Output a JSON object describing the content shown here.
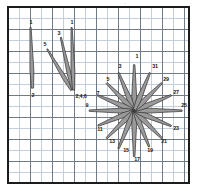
{
  "figure": {
    "kind": "petal-rose-diagram",
    "background": "#ffffff",
    "frame_color": "#1c1c1c",
    "grid_minor_color": "#c3cfdd",
    "grid_major_color": "#707b87",
    "petal_fill": "#9a9a9a",
    "petal_stroke": "#2b2b2b",
    "label_color": "#1a1a1a",
    "top_mark": "·"
  },
  "chart_data": {
    "type": "scatter",
    "title": "",
    "subtitle": "",
    "xlabel": "",
    "ylabel": "",
    "grid": true,
    "legend_position": "none",
    "annotations": [
      "Left cluster of three narrow petals converging at a common base labeled 2,4,6",
      "Right radial starburst of sixteen petals about a common centre, tips labelled with odd numbers 1 through 31"
    ],
    "groups": [
      {
        "name": "left-cluster",
        "base_label": "2,4,6",
        "petals": [
          {
            "tip_label": "1",
            "tip_x": 22,
            "tip_y": 20,
            "base_x": 24,
            "base_y": 82,
            "width": 4.0
          },
          {
            "tip_label": "5",
            "tip_x": 39,
            "tip_y": 42,
            "base_x": 64,
            "base_y": 84,
            "width": 4.0
          },
          {
            "tip_label": "3",
            "tip_x": 53,
            "tip_y": 30,
            "base_x": 65,
            "base_y": 83,
            "width": 4.0
          },
          {
            "tip_label": "1",
            "tip_x": 64,
            "tip_y": 20,
            "base_x": 66,
            "base_y": 84,
            "width": 4.0
          }
        ],
        "tip_labels_shown": [
          "1",
          "5",
          "3",
          "1"
        ],
        "base_labels_shown": [
          "2",
          "2,4,6"
        ]
      },
      {
        "name": "starburst",
        "centre_x": 128,
        "centre_y": 105,
        "petal_count": 16,
        "angle_step_deg": 22.5,
        "petals": [
          {
            "label": "1",
            "angle_deg": 90,
            "length": 47,
            "width": 5.0
          },
          {
            "label": "3",
            "angle_deg": 112.5,
            "length": 42,
            "width": 5.0
          },
          {
            "label": "5",
            "angle_deg": 135,
            "length": 40,
            "width": 5.0
          },
          {
            "label": "7",
            "angle_deg": 157.5,
            "length": 40,
            "width": 5.0
          },
          {
            "label": "9",
            "angle_deg": 180,
            "length": 46,
            "width": 5.0
          },
          {
            "label": "11",
            "angle_deg": 202.5,
            "length": 40,
            "width": 5.0
          },
          {
            "label": "13",
            "angle_deg": 225,
            "length": 40,
            "width": 5.0
          },
          {
            "label": "15",
            "angle_deg": 247.5,
            "length": 42,
            "width": 5.0
          },
          {
            "label": "17",
            "angle_deg": 270,
            "length": 47,
            "width": 5.0
          },
          {
            "label": "19",
            "angle_deg": 292.5,
            "length": 40,
            "width": 5.0
          },
          {
            "label": "21",
            "angle_deg": 315,
            "length": 40,
            "width": 5.0
          },
          {
            "label": "23",
            "angle_deg": 337.5,
            "length": 41,
            "width": 5.0
          },
          {
            "label": "25",
            "angle_deg": 0,
            "length": 49,
            "width": 5.0
          },
          {
            "label": "27",
            "angle_deg": 22.5,
            "length": 41,
            "width": 5.0
          },
          {
            "label": "29",
            "angle_deg": 45,
            "length": 40,
            "width": 5.0
          },
          {
            "label": "31",
            "angle_deg": 67.5,
            "length": 42,
            "width": 5.0
          }
        ]
      }
    ],
    "labels": [
      {
        "text": "1",
        "x": 22,
        "y": 15
      },
      {
        "text": "2",
        "x": 24,
        "y": 88
      },
      {
        "text": "5",
        "x": 36,
        "y": 37
      },
      {
        "text": "3",
        "x": 50,
        "y": 26
      },
      {
        "text": "1",
        "x": 63,
        "y": 15
      },
      {
        "text": "2,4,6",
        "x": 72,
        "y": 89
      },
      {
        "text": "1",
        "x": 128,
        "y": 49
      },
      {
        "text": "3",
        "x": 111,
        "y": 59
      },
      {
        "text": "31",
        "x": 146,
        "y": 59
      },
      {
        "text": "5",
        "x": 99,
        "y": 72
      },
      {
        "text": "29",
        "x": 157,
        "y": 72
      },
      {
        "text": "7",
        "x": 89,
        "y": 86
      },
      {
        "text": "27",
        "x": 167,
        "y": 85
      },
      {
        "text": "9",
        "x": 78,
        "y": 98
      },
      {
        "text": "25",
        "x": 175,
        "y": 98
      },
      {
        "text": "11",
        "x": 91,
        "y": 122
      },
      {
        "text": "23",
        "x": 167,
        "y": 121
      },
      {
        "text": "13",
        "x": 103,
        "y": 134
      },
      {
        "text": "21",
        "x": 155,
        "y": 134
      },
      {
        "text": "15",
        "x": 117,
        "y": 143
      },
      {
        "text": "19",
        "x": 141,
        "y": 143
      },
      {
        "text": "17",
        "x": 128,
        "y": 152
      }
    ]
  }
}
